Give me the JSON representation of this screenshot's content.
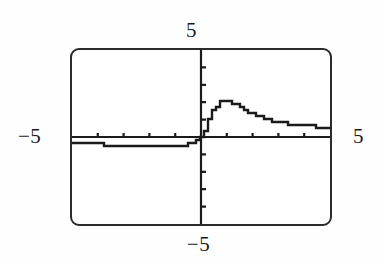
{
  "figure": {
    "kind": "graphing-calculator-screen",
    "caption": ""
  },
  "screen": {
    "frame_color": "#2b2b2b",
    "background_color": "#ffffff",
    "plot_color": "#1b1b1b",
    "axis_color": "#1b1b1b"
  },
  "labels": {
    "y_max": "5",
    "y_min": "−5",
    "x_min": "−5",
    "x_max": "5"
  },
  "chart_data": {
    "type": "line",
    "title": "",
    "xlabel": "",
    "ylabel": "",
    "xlim": [
      -5,
      5
    ],
    "ylim": [
      -5,
      5
    ],
    "grid": false,
    "legend": null,
    "axes": {
      "x_axis_drawn": true,
      "y_axis_drawn": true,
      "x_tick_interval": 1,
      "y_tick_interval": 1,
      "x_ticks": [
        -5,
        -4,
        -3,
        -2,
        -1,
        0,
        1,
        2,
        3,
        4,
        5
      ],
      "y_ticks": [
        -5,
        -4,
        -3,
        -2,
        -1,
        0,
        1,
        2,
        3,
        4,
        5
      ]
    },
    "series": [
      {
        "name": "curve",
        "x": [
          -5.0,
          -4.7,
          -4.4,
          -4.1,
          -3.8,
          -3.5,
          -3.2,
          -2.9,
          -2.6,
          -2.3,
          -2.0,
          -1.7,
          -1.4,
          -1.1,
          -0.9,
          -0.7,
          -0.55,
          -0.42,
          -0.32,
          -0.24,
          -0.17,
          -0.11,
          -0.06,
          -0.02,
          0.0,
          0.03,
          0.07,
          0.12,
          0.18,
          0.25,
          0.33,
          0.42,
          0.53,
          0.66,
          0.8,
          0.95,
          1.1,
          1.25,
          1.4,
          1.55,
          1.7,
          1.85,
          2.0,
          2.2,
          2.45,
          2.7,
          3.0,
          3.3,
          3.65,
          4.0,
          4.35,
          4.7,
          5.0
        ],
        "y": [
          -0.3,
          -0.32,
          -0.35,
          -0.4,
          -0.44,
          -0.48,
          -0.52,
          -0.55,
          -0.58,
          -0.59,
          -0.6,
          -0.6,
          -0.6,
          -0.58,
          -0.55,
          -0.5,
          -0.44,
          -0.37,
          -0.29,
          -0.22,
          -0.15,
          -0.09,
          -0.04,
          -0.01,
          0.0,
          0.08,
          0.22,
          0.42,
          0.65,
          0.92,
          1.2,
          1.48,
          1.72,
          1.92,
          2.05,
          2.1,
          2.05,
          1.95,
          1.82,
          1.68,
          1.55,
          1.43,
          1.32,
          1.18,
          1.04,
          0.94,
          0.84,
          0.77,
          0.7,
          0.65,
          0.61,
          0.58,
          0.57
        ]
      }
    ]
  }
}
